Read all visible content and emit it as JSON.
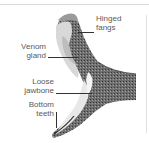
{
  "diagram": {
    "labels": [
      {
        "id": "hinged-fangs",
        "line1": "Hinged",
        "line2": "fangs"
      },
      {
        "id": "venom-gland",
        "line1": "Venom",
        "line2": "gland"
      },
      {
        "id": "loose-jawbone",
        "line1": "Loose",
        "line2": "jawbone"
      },
      {
        "id": "bottom-teeth",
        "line1": "Bottom",
        "line2": "teeth"
      }
    ],
    "colors": {
      "label_text": "#5a5a5a",
      "leader_line": "#333333",
      "illustration_dark": "#3a3a3a",
      "illustration_light": "#e6e6e6"
    }
  }
}
